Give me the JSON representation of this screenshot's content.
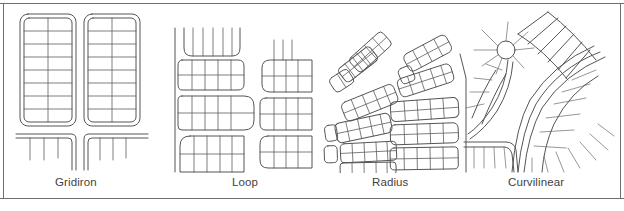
{
  "figure": {
    "background_color": "#ffffff",
    "line_color": "#555555",
    "frame_color": "#6e6e6e",
    "text_color": "#3f3f3f",
    "panel_count": 4
  },
  "panels": [
    {
      "id": "gridiron",
      "caption": "Gridiron",
      "description": "Two rectangular superblocks with double-line perimeter roads, a single central north-south street and eight east-west cross streets; short stub streets hang from the collector roads below."
    },
    {
      "id": "loop",
      "caption": "Loop",
      "description": "Vertical arterial on the left with stacked rounded-end loop blocks; internal grid of lots inside each loop, cul-de-sac style rounded terminations."
    },
    {
      "id": "radius",
      "caption": "Radius",
      "description": "Angled and rotated lot blocks fanning out at varying bearings around a radial spine; two clusters of skewed rounded blocks subdivided into narrow lots."
    },
    {
      "id": "curvilinear",
      "caption": "Curvilinear",
      "description": "Circular cul-de-sac bulb with radiating lot lines feeding sweeping curved double-line collector roads; lots arranged perpendicular to the curves."
    }
  ],
  "captions": {
    "gridiron": "Gridiron",
    "loop": "Loop",
    "radius": "Radius",
    "curvilinear": "Curvilinear"
  }
}
